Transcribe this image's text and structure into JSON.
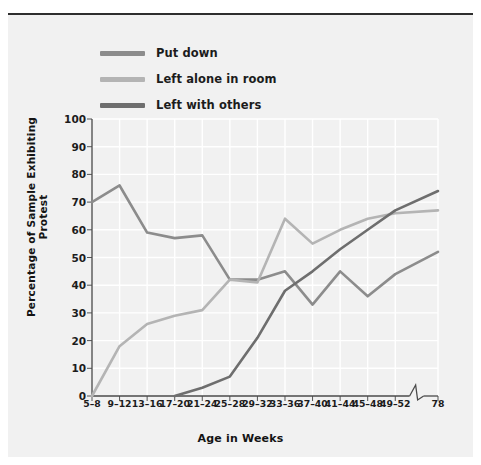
{
  "figure": {
    "background": "#f1f1f1",
    "page_background": "#ffffff"
  },
  "legend": {
    "position": "top-left",
    "items": [
      {
        "label": "Put down",
        "color": "#8c8c8c",
        "key": "put_down"
      },
      {
        "label": "Left alone in room",
        "color": "#b4b4b4",
        "key": "left_alone"
      },
      {
        "label": "Left with others",
        "color": "#6e6e6e",
        "key": "left_with_others"
      }
    ]
  },
  "axes": {
    "ylabel": "Percentage of Sample Exhibiting Protest",
    "xlabel": "Age in Weeks",
    "yticks": [
      0,
      10,
      20,
      30,
      40,
      50,
      60,
      70,
      80,
      90,
      100
    ],
    "ylim": [
      0,
      100
    ],
    "xticks": [
      "5–8",
      "9–12",
      "13–16",
      "17–20",
      "21–24",
      "25–28",
      "29–32",
      "33–36",
      "37–40",
      "41–44",
      "45–48",
      "49–52",
      "78"
    ],
    "axis_break_after": "49–52",
    "grid": true,
    "grid_color": "#ffffff"
  },
  "chart_data": {
    "type": "line",
    "title": "",
    "xlabel": "Age in Weeks",
    "ylabel": "Percentage of Sample Exhibiting Protest",
    "ylim": [
      0,
      100
    ],
    "grid": true,
    "legend_position": "top-left",
    "categories": [
      "5–8",
      "9–12",
      "13–16",
      "17–20",
      "21–24",
      "25–28",
      "29–32",
      "33–36",
      "37–40",
      "41–44",
      "45–48",
      "49–52",
      "78"
    ],
    "series": [
      {
        "name": "Put down",
        "color": "#8c8c8c",
        "values": [
          70,
          76,
          59,
          57,
          58,
          42,
          42,
          45,
          33,
          45,
          36,
          44,
          52
        ]
      },
      {
        "name": "Left alone in room",
        "color": "#b4b4b4",
        "values": [
          0,
          18,
          26,
          29,
          31,
          42,
          41,
          64,
          55,
          60,
          64,
          66,
          67
        ]
      },
      {
        "name": "Left with others",
        "color": "#6e6e6e",
        "values": [
          null,
          null,
          null,
          0,
          3,
          7,
          21,
          38,
          45,
          53,
          60,
          67,
          74
        ]
      }
    ],
    "annotations": [
      {
        "type": "axis-break",
        "axis": "x",
        "between": [
          "49–52",
          "78"
        ]
      }
    ]
  }
}
